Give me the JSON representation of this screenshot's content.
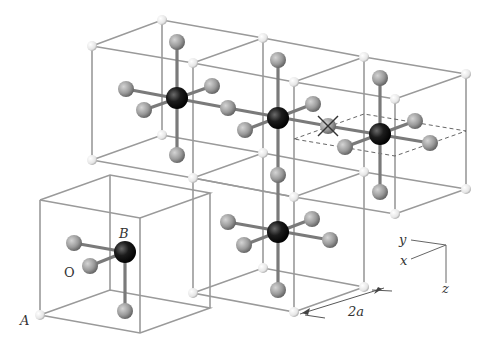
{
  "figure": {
    "type": "crystal-structure-diagram",
    "labels": {
      "A": "A",
      "B": "B",
      "O": "O",
      "dimension": "2a"
    },
    "axes": {
      "x": "x",
      "y": "y",
      "z": "z"
    },
    "colors": {
      "corner_atom_A": "#f2f2f2",
      "center_atom_B": "#1a1a1a",
      "oxygen_atom_O": "#9c9c9c",
      "edges": "#9a9a9a",
      "bonds": "#7a7a7a"
    },
    "markers": {
      "vacancy": "cross-marked oxygen site between two B atoms",
      "dashed_plane": "dashed parallelogram through right cube"
    }
  }
}
